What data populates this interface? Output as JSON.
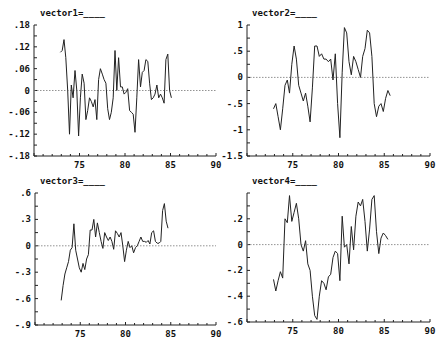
{
  "chart_data": [
    {
      "type": "line",
      "title": "vector1=____",
      "xlabel": "",
      "ylabel": "",
      "xlim": [
        70,
        90
      ],
      "ylim": [
        -0.18,
        0.18
      ],
      "xticks": [
        75,
        80,
        85,
        90
      ],
      "xtick_labels": [
        "75",
        "80",
        "85",
        "90"
      ],
      "yticks": [
        0.18,
        0.12,
        0.06,
        0,
        -0.06,
        -0.12,
        -0.18
      ],
      "ytick_labels": [
        ".18",
        ".12",
        ".06",
        "0",
        "-.06",
        "-.12",
        "-.18"
      ],
      "zero_line": true,
      "x": [
        72.9,
        73.1,
        73.3,
        73.5,
        73.7,
        73.9,
        74.1,
        74.3,
        74.5,
        74.7,
        74.9,
        75.1,
        75.3,
        75.5,
        75.7,
        75.9,
        76.1,
        76.3,
        76.5,
        76.7,
        76.9,
        77.1,
        77.3,
        77.5,
        77.7,
        77.9,
        78.1,
        78.3,
        78.5,
        78.7,
        78.9,
        79.1,
        79.3,
        79.5,
        79.7,
        79.9,
        80.1,
        80.3,
        80.5,
        80.7,
        80.9,
        81.1,
        81.3,
        81.5,
        81.7,
        81.9,
        82.1,
        82.3,
        82.5,
        82.7,
        82.9,
        83.1,
        83.3,
        83.5,
        83.7,
        83.9,
        84.1,
        84.3,
        84.5,
        84.7,
        84.9,
        85.1,
        85.3,
        85.5,
        85.7,
        85.9,
        86.1,
        86.3,
        86.5,
        86.7,
        86.9,
        87.1,
        87.3
      ],
      "values": [
        0.105,
        0.11,
        0.14,
        0.09,
        0.0,
        -0.12,
        0.015,
        -0.02,
        0.055,
        0.0,
        -0.125,
        -0.02,
        0.045,
        0.02,
        -0.08,
        -0.055,
        -0.02,
        -0.03,
        -0.045,
        -0.025,
        -0.08,
        0.03,
        0.06,
        0.045,
        0.03,
        0.02,
        -0.05,
        -0.08,
        -0.06,
        -0.02,
        0.11,
        0.0,
        0.09,
        0.01,
        0.01,
        -0.01,
        -0.005,
        0.005,
        -0.055,
        -0.06,
        -0.065,
        -0.115,
        -0.02,
        0.085,
        0.01,
        0.05,
        0.055,
        0.085,
        0.08,
        0.02,
        -0.025,
        -0.02,
        -0.01,
        0.015,
        -0.02,
        -0.01,
        -0.02,
        -0.035,
        0.085,
        0.1,
        0.0,
        -0.02
      ],
      "line_color": "#222222"
    },
    {
      "type": "line",
      "title": "vector2=____",
      "xlabel": "",
      "ylabel": "",
      "xlim": [
        70,
        90
      ],
      "ylim": [
        -1.5,
        1
      ],
      "xticks": [
        75,
        80,
        85,
        90
      ],
      "xtick_labels": [
        "75",
        "80",
        "85",
        "90"
      ],
      "yticks": [
        1,
        0.5,
        0,
        -0.5,
        -1,
        -1.5
      ],
      "ytick_labels": [
        "1",
        ".5",
        "0",
        "-.5",
        "-1",
        "-1.5"
      ],
      "zero_line": true,
      "x": [
        72.9,
        73.15,
        73.4,
        73.65,
        73.9,
        74.15,
        74.4,
        74.65,
        74.9,
        75.15,
        75.4,
        75.65,
        75.9,
        76.15,
        76.4,
        76.65,
        76.9,
        77.15,
        77.4,
        77.65,
        77.9,
        78.15,
        78.4,
        78.65,
        78.9,
        79.15,
        79.4,
        79.65,
        79.9,
        80.15,
        80.4,
        80.65,
        80.9,
        81.15,
        81.4,
        81.65,
        81.9,
        82.15,
        82.4,
        82.65,
        82.9,
        83.15,
        83.4,
        83.65,
        83.9,
        84.15,
        84.4,
        84.65,
        84.9,
        85.15,
        85.4,
        85.65,
        85.9,
        86.15,
        86.4,
        86.65,
        86.9,
        87.15,
        87.4
      ],
      "values": [
        -0.6,
        -0.5,
        -0.75,
        -1.0,
        -0.6,
        -0.15,
        -0.05,
        -0.3,
        0.25,
        0.6,
        0.35,
        -0.15,
        -0.3,
        -0.45,
        -0.3,
        -0.55,
        -0.85,
        -0.2,
        0.6,
        0.6,
        0.4,
        0.45,
        0.35,
        0.35,
        0.3,
        0.35,
        -0.05,
        0.45,
        -0.5,
        -1.15,
        0.1,
        0.95,
        0.85,
        0.3,
        0.05,
        0.4,
        0.3,
        0.15,
        0.0,
        0.4,
        0.55,
        0.9,
        0.85,
        0.4,
        -0.5,
        -0.75,
        -0.55,
        -0.5,
        -0.65,
        -0.4,
        -0.25,
        -0.35
      ],
      "line_color": "#222222"
    },
    {
      "type": "line",
      "title": "vector3=____",
      "xlabel": "",
      "ylabel": "",
      "xlim": [
        70,
        90
      ],
      "ylim": [
        -0.9,
        0.6
      ],
      "xticks": [
        75,
        80,
        85,
        90
      ],
      "xtick_labels": [
        "75",
        "80",
        "85",
        "90"
      ],
      "yticks": [
        0.6,
        0.3,
        0,
        -0.3,
        -0.6,
        -0.9
      ],
      "ytick_labels": [
        ".6",
        ".3",
        "0",
        "-.3",
        "-.6",
        "-.9"
      ],
      "zero_line": true,
      "x": [
        72.9,
        73.1,
        73.3,
        73.5,
        73.7,
        73.9,
        74.1,
        74.3,
        74.5,
        74.7,
        74.9,
        75.1,
        75.3,
        75.5,
        75.7,
        75.9,
        76.1,
        76.3,
        76.5,
        76.7,
        76.9,
        77.1,
        77.3,
        77.5,
        77.7,
        77.9,
        78.1,
        78.3,
        78.5,
        78.7,
        78.9,
        79.1,
        79.3,
        79.5,
        79.7,
        79.9,
        80.1,
        80.3,
        80.5,
        80.7,
        80.9,
        81.1,
        81.3,
        81.5,
        81.7,
        81.9,
        82.1,
        82.3,
        82.5,
        82.7,
        82.9,
        83.1,
        83.3,
        83.5,
        83.7,
        83.9,
        84.1,
        84.3,
        84.5,
        84.7,
        84.9,
        85.1,
        85.3,
        85.5,
        85.7,
        85.9,
        86.1,
        86.3,
        86.5,
        86.7,
        86.9,
        87.1,
        87.3,
        87.5
      ],
      "values": [
        -0.62,
        -0.45,
        -0.32,
        -0.25,
        -0.18,
        -0.05,
        -0.02,
        0.25,
        -0.05,
        -0.15,
        -0.25,
        -0.3,
        -0.2,
        -0.27,
        -0.15,
        -0.1,
        0.18,
        0.18,
        0.3,
        0.1,
        0.26,
        0.15,
        0.05,
        -0.03,
        0.15,
        0.1,
        0.06,
        0.1,
        0.05,
        -0.04,
        0.17,
        0.14,
        0.1,
        0.15,
        0.0,
        -0.18,
        -0.05,
        0.05,
        -0.02,
        0.0,
        -0.08,
        -0.02,
        0.0,
        0.05,
        0.1,
        0.05,
        0.05,
        0.04,
        0.06,
        0.02,
        0.15,
        0.17,
        0.05,
        0.03,
        0.03,
        0.05,
        0.4,
        0.48,
        0.28,
        0.2
      ],
      "line_color": "#222222"
    },
    {
      "type": "line",
      "title": "vector4=____",
      "xlabel": "",
      "ylabel": "",
      "xlim": [
        70,
        90
      ],
      "ylim": [
        -0.6,
        0.4
      ],
      "xticks": [
        75,
        80,
        85,
        90
      ],
      "xtick_labels": [
        "75",
        "80",
        "85",
        "90"
      ],
      "yticks": [
        0.2,
        0,
        -0.2,
        -0.4,
        -0.6
      ],
      "ytick_labels": [
        ".2",
        "0",
        "-.2",
        "-.4",
        "-.6"
      ],
      "zero_line": true,
      "x": [
        72.9,
        73.15,
        73.4,
        73.65,
        73.9,
        74.15,
        74.4,
        74.65,
        74.9,
        75.15,
        75.4,
        75.65,
        75.9,
        76.15,
        76.4,
        76.65,
        76.9,
        77.15,
        77.4,
        77.65,
        77.9,
        78.15,
        78.4,
        78.65,
        78.9,
        79.15,
        79.4,
        79.65,
        79.9,
        80.15,
        80.4,
        80.65,
        80.9,
        81.15,
        81.4,
        81.65,
        81.9,
        82.15,
        82.4,
        82.65,
        82.9,
        83.15,
        83.4,
        83.65,
        83.9,
        84.15,
        84.4,
        84.65,
        84.9,
        85.15,
        85.4,
        85.65,
        85.9,
        86.15,
        86.4,
        86.65,
        86.9,
        87.15,
        87.4
      ],
      "values": [
        -0.27,
        -0.36,
        -0.28,
        -0.21,
        -0.26,
        0.2,
        0.17,
        0.38,
        0.18,
        0.25,
        0.32,
        0.2,
        0.0,
        -0.05,
        0.03,
        -0.15,
        -0.2,
        -0.4,
        -0.55,
        -0.58,
        -0.4,
        -0.28,
        -0.3,
        -0.35,
        -0.25,
        -0.23,
        -0.1,
        -0.05,
        -0.07,
        -0.28,
        0.22,
        -0.02,
        0.0,
        -0.15,
        0.14,
        -0.04,
        0.22,
        0.33,
        0.3,
        0.35,
        0.18,
        -0.05,
        0.12,
        0.35,
        0.38,
        0.1,
        -0.07,
        0.05,
        0.09,
        0.07,
        0.04
      ],
      "line_color": "#222222"
    }
  ]
}
